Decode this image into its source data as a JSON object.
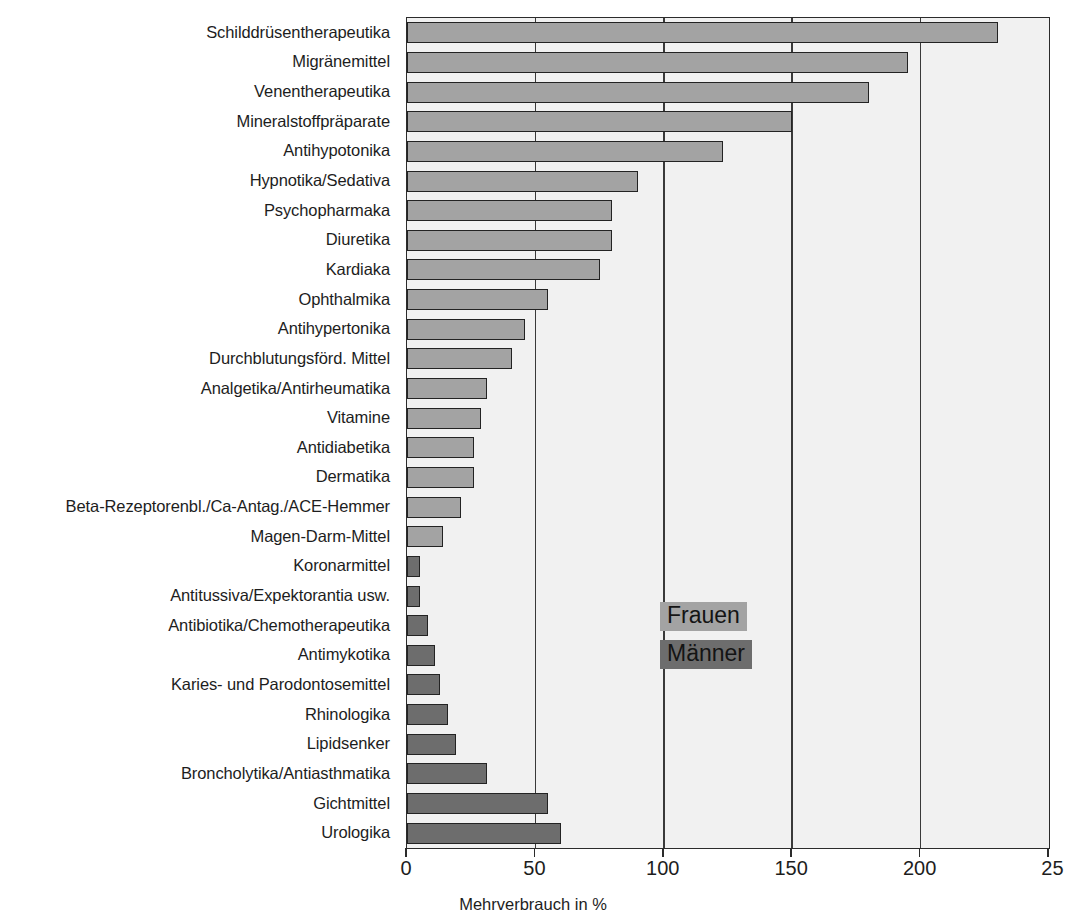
{
  "chart_data": {
    "type": "bar",
    "orientation": "horizontal",
    "title": "",
    "subtitle": "",
    "xlabel": "Mehrverbrauch in %",
    "ylabel": "",
    "xlim": [
      0,
      250
    ],
    "xticks": [
      0,
      50,
      100,
      150,
      200,
      250
    ],
    "xtick_labels": [
      "0",
      "50",
      "100",
      "150",
      "200",
      "25"
    ],
    "grid": "vertical",
    "legend_position": "center-right-inside",
    "legend": [
      "Frauen",
      "Männer"
    ],
    "series": [
      {
        "name": "Frauen",
        "color": "#a3a3a3",
        "categories": [
          "Schilddrüsentherapeutika",
          "Migränemittel",
          "Venentherapeutika",
          "Mineralstoffpräparate",
          "Antihypotonika",
          "Hypnotika/Sedativa",
          "Psychopharmaka",
          "Diuretika",
          "Kardiaka",
          "Ophthalmika",
          "Antihypertonika",
          "Durchblutungsförd. Mittel",
          "Analgetika/Antirheumatika",
          "Vitamine",
          "Antidiabetika",
          "Dermatika",
          "Beta-Rezeptorenbl./Ca-Antag./ACE-Hemmer",
          "Magen-Darm-Mittel"
        ],
        "values": [
          230,
          195,
          180,
          150,
          123,
          90,
          80,
          80,
          75,
          55,
          46,
          41,
          31,
          29,
          26,
          26,
          21,
          14
        ]
      },
      {
        "name": "Männer",
        "color": "#6d6d6d",
        "categories": [
          "Koronarmittel",
          "Antitussiva/Expektorantia usw.",
          "Antibiotika/Chemotherapeutika",
          "Antimykotika",
          "Karies- und Parodontosemittel",
          "Rhinologika",
          "Lipidsenker",
          "Broncholytika/Antiasthmatika",
          "Gichtmittel",
          "Urologika"
        ],
        "values": [
          5,
          5,
          8,
          11,
          13,
          16,
          19,
          31,
          55,
          60
        ]
      }
    ],
    "categories_ordered": [
      "Schilddrüsentherapeutika",
      "Migränemittel",
      "Venentherapeutika",
      "Mineralstoffpräparate",
      "Antihypotonika",
      "Hypnotika/Sedativa",
      "Psychopharmaka",
      "Diuretika",
      "Kardiaka",
      "Ophthalmika",
      "Antihypertonika",
      "Durchblutungsförd. Mittel",
      "Analgetika/Antirheumatika",
      "Vitamine",
      "Antidiabetika",
      "Dermatika",
      "Beta-Rezeptorenbl./Ca-Antag./ACE-Hemmer",
      "Magen-Darm-Mittel",
      "Koronarmittel",
      "Antitussiva/Expektorantia usw.",
      "Antibiotika/Chemotherapeutika",
      "Antimykotika",
      "Karies- und Parodontosemittel",
      "Rhinologika",
      "Lipidsenker",
      "Broncholytika/Antiasthmatika",
      "Gichtmittel",
      "Urologika"
    ],
    "values_ordered": [
      230,
      195,
      180,
      150,
      123,
      90,
      80,
      80,
      75,
      55,
      46,
      41,
      31,
      29,
      26,
      26,
      21,
      14,
      5,
      5,
      8,
      11,
      13,
      16,
      19,
      31,
      55,
      60
    ],
    "group_ordered": [
      "Frauen",
      "Frauen",
      "Frauen",
      "Frauen",
      "Frauen",
      "Frauen",
      "Frauen",
      "Frauen",
      "Frauen",
      "Frauen",
      "Frauen",
      "Frauen",
      "Frauen",
      "Frauen",
      "Frauen",
      "Frauen",
      "Frauen",
      "Frauen",
      "Männer",
      "Männer",
      "Männer",
      "Männer",
      "Männer",
      "Männer",
      "Männer",
      "Männer",
      "Männer",
      "Männer"
    ]
  },
  "axis": {
    "x_title": "Mehrverbrauch in %",
    "tick_labels": [
      "0",
      "50",
      "100",
      "150",
      "200",
      "25"
    ]
  },
  "legend": {
    "frauen_label": "Frauen",
    "maenner_label": "Männer"
  },
  "colors": {
    "frauen": "#a3a3a3",
    "maenner": "#6d6d6d",
    "plot_background": "#f1f1f1",
    "axis": "#2b2b2b"
  }
}
